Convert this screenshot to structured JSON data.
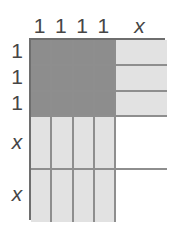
{
  "diagram": {
    "colors": {
      "dark": "#8d8d8d",
      "light": "#e2e2e2",
      "white": "#ffffff",
      "outline": "#6e6e6e",
      "gridline": "#8e8e8e",
      "text": "#464646"
    },
    "column_headers": [
      {
        "label": "1",
        "kind": "unit"
      },
      {
        "label": "1",
        "kind": "unit"
      },
      {
        "label": "1",
        "kind": "unit"
      },
      {
        "label": "1",
        "kind": "unit"
      },
      {
        "label": "x",
        "kind": "var"
      }
    ],
    "row_headers": [
      {
        "label": "1",
        "kind": "unit"
      },
      {
        "label": "1",
        "kind": "unit"
      },
      {
        "label": "1",
        "kind": "unit"
      },
      {
        "label": "x",
        "kind": "var"
      },
      {
        "label": "x",
        "kind": "var"
      }
    ],
    "rows": [
      {
        "kind": "unit",
        "cells": [
          "dark",
          "dark",
          "dark",
          "dark",
          "light"
        ]
      },
      {
        "kind": "unit",
        "cells": [
          "dark",
          "dark",
          "dark",
          "dark",
          "light"
        ]
      },
      {
        "kind": "unit",
        "cells": [
          "dark",
          "dark",
          "dark",
          "dark",
          "light"
        ]
      },
      {
        "kind": "var",
        "cells": [
          "light",
          "light",
          "light",
          "light",
          "white"
        ]
      },
      {
        "kind": "var",
        "cells": [
          "light",
          "light",
          "light",
          "light",
          "white"
        ]
      }
    ]
  }
}
